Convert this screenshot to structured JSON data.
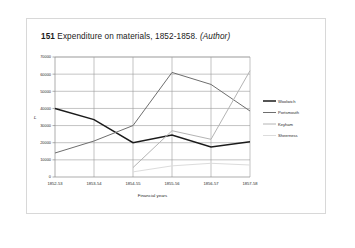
{
  "caption": {
    "number": "151",
    "text": "Expenditure on materials, 1852-1858.",
    "attribution": "(Author)"
  },
  "chart_data": {
    "type": "line",
    "title": "",
    "xlabel": "Financial years",
    "ylabel": "£",
    "categories": [
      "1852-53",
      "1853-54",
      "1854-55",
      "1855-56",
      "1856-57",
      "1857-58"
    ],
    "ylim": [
      0,
      70000
    ],
    "ytick_step": 10000,
    "yticks": [
      "0",
      "10000",
      "20000",
      "30000",
      "40000",
      "50000",
      "60000",
      "70000"
    ],
    "grid": true,
    "legend_position": "right",
    "series": [
      {
        "name": "Woolwich",
        "color": "#1b1b1b",
        "width": 1.5,
        "values": [
          40000,
          33500,
          20000,
          24500,
          17500,
          20500
        ]
      },
      {
        "name": "Portsmouth",
        "color": "#6e6e6e",
        "width": 1.0,
        "values": [
          14000,
          21000,
          30000,
          61000,
          54000,
          38500
        ]
      },
      {
        "name": "Keyham",
        "color": "#b4b4b4",
        "width": 1.0,
        "values": [
          null,
          null,
          5500,
          27000,
          22000,
          62000
        ]
      },
      {
        "name": "Sheerness",
        "color": "#dcdcdc",
        "width": 1.0,
        "values": [
          null,
          null,
          3000,
          6500,
          8000,
          7000
        ]
      }
    ]
  },
  "legend": {
    "items": [
      {
        "label": "Woolwich"
      },
      {
        "label": "Portsmouth"
      },
      {
        "label": "Keyham"
      },
      {
        "label": "Sheerness"
      }
    ]
  }
}
